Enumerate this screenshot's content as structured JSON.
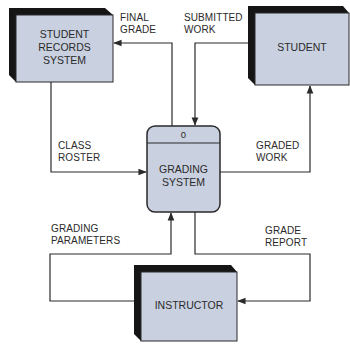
{
  "diagram": {
    "type": "context data flow diagram",
    "colors": {
      "entity_fill": "#c9d0e0",
      "entity_shadow": "#151515",
      "process_fill": "#c9d0e0",
      "line": "#2a2a2a",
      "text": "#2a2a2a"
    },
    "entities": {
      "student_records": {
        "line1": "STUDENT",
        "line2": "RECORDS",
        "line3": "SYSTEM"
      },
      "student": {
        "label": "STUDENT"
      },
      "instructor": {
        "label": "INSTRUCTOR"
      }
    },
    "process": {
      "id": "0",
      "line1": "GRADING",
      "line2": "SYSTEM"
    },
    "flows": {
      "final_grade": {
        "line1": "FINAL",
        "line2": "GRADE"
      },
      "submitted_work": {
        "line1": "SUBMITTED",
        "line2": "WORK"
      },
      "class_roster": {
        "line1": "CLASS",
        "line2": "ROSTER"
      },
      "graded_work": {
        "line1": "GRADED",
        "line2": "WORK"
      },
      "grading_parameters": {
        "line1": "GRADING",
        "line2": "PARAMETERS"
      },
      "grade_report": {
        "line1": "GRADE",
        "line2": "REPORT"
      }
    }
  }
}
